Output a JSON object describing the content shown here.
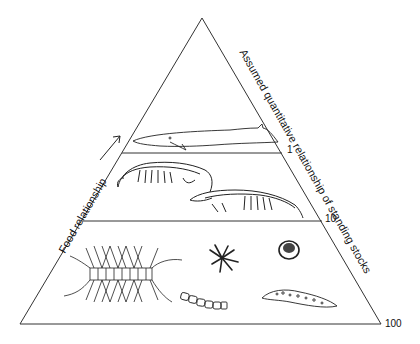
{
  "diagram": {
    "type": "ecological pyramid",
    "left_axis_label": "Food relationship",
    "right_axis_label": "Assumed quantitative relationship of standing stocks",
    "levels": [
      {
        "name": "whale",
        "description": "Baleen whale (top consumer)",
        "stock_value": "1"
      },
      {
        "name": "krill",
        "description": "Krill / euphausiid crustaceans",
        "stock_value": "10"
      },
      {
        "name": "phytoplankton",
        "description": "Diatoms and other phytoplankton",
        "stock_value": "100"
      }
    ],
    "line_color": "#333333",
    "background": "#ffffff"
  }
}
